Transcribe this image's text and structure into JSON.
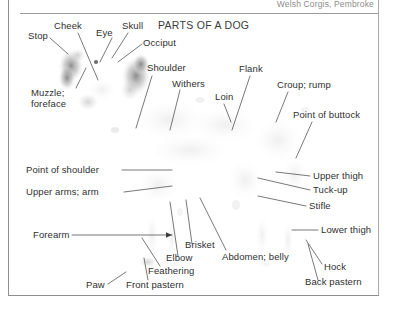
{
  "page": {
    "running_head": "Welsh Corgis, Pembroke",
    "figure_title": "PARTS OF A DOG",
    "text_color": "#2f2f2f",
    "rule_color": "#8e8e8e",
    "background": "#ffffff"
  },
  "figure": {
    "labels": [
      {
        "id": "stop",
        "text": "Stop"
      },
      {
        "id": "cheek",
        "text": "Cheek"
      },
      {
        "id": "eye",
        "text": "Eye"
      },
      {
        "id": "skull",
        "text": "Skull"
      },
      {
        "id": "occiput",
        "text": "Occiput"
      },
      {
        "id": "muzzle-foreface",
        "text": "Muzzle; foreface"
      },
      {
        "id": "shoulder",
        "text": "Shoulder"
      },
      {
        "id": "withers",
        "text": "Withers"
      },
      {
        "id": "loin",
        "text": "Loin"
      },
      {
        "id": "flank",
        "text": "Flank"
      },
      {
        "id": "croup-rump",
        "text": "Croup; rump"
      },
      {
        "id": "point-of-buttock",
        "text": "Point of buttock"
      },
      {
        "id": "point-of-shoulder",
        "text": "Point of shoulder"
      },
      {
        "id": "upper-arms-arm",
        "text": "Upper arms; arm"
      },
      {
        "id": "upper-thigh",
        "text": "Upper thigh"
      },
      {
        "id": "tuck-up",
        "text": "Tuck-up"
      },
      {
        "id": "stifle",
        "text": "Stifle"
      },
      {
        "id": "lower-thigh",
        "text": "Lower thigh"
      },
      {
        "id": "forearm",
        "text": "Forearm"
      },
      {
        "id": "brisket",
        "text": "Brisket"
      },
      {
        "id": "elbow",
        "text": "Elbow"
      },
      {
        "id": "feathering",
        "text": "Feathering"
      },
      {
        "id": "abdomen-belly",
        "text": "Abdomen; belly"
      },
      {
        "id": "paw",
        "text": "Paw"
      },
      {
        "id": "front-pastern",
        "text": "Front pastern"
      },
      {
        "id": "hock",
        "text": "Hock"
      },
      {
        "id": "back-pastern",
        "text": "Back pastern"
      }
    ],
    "muzzle_lines": {
      "line1": "Muzzle;",
      "line2": "foreface"
    }
  }
}
